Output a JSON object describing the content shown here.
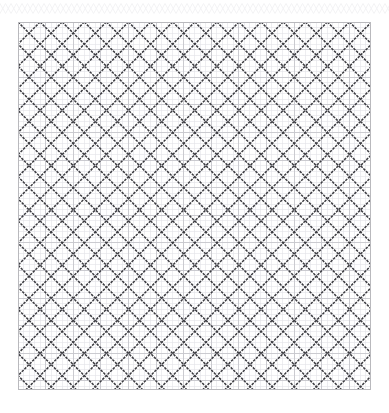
{
  "page": {
    "width": 389,
    "height": 413,
    "background_color": "#ffffff",
    "title": "",
    "caption": ""
  },
  "top_band": {
    "name": "decorative-zigzag-band",
    "x": 0,
    "y": 0,
    "width": 389,
    "height": 15,
    "stroke_color": "#e9e9ec",
    "stroke_width": 1,
    "motif": "zigzag-crosshatch",
    "period": 11,
    "amplitude": 5
  },
  "panel": {
    "name": "graph-paper-panel",
    "x": 18,
    "y": 22,
    "width": 353,
    "height": 368,
    "background_color": "#ffffff",
    "border_color": "#b9b9bd",
    "border_width": 1
  },
  "grid": {
    "minor": {
      "spacing": 5.52,
      "color": "#e3e3e8",
      "width": 0.6,
      "columns": 64,
      "rows": 67
    },
    "major": {
      "spacing": 27.6,
      "color": "#c6c6cc",
      "width": 0.9,
      "columns": 13,
      "rows": 14
    }
  },
  "chart_data": {
    "type": "pattern",
    "title": "",
    "subtitle": "",
    "xlabel": "",
    "ylabel": "",
    "grid": true,
    "legend": "none",
    "motif": "x-cross",
    "lattice": {
      "period_x": 22.1,
      "period_y": 22.1,
      "origin_x": 18,
      "origin_y": 22,
      "cells_x": 16,
      "cells_y": 17,
      "stroke_color": "#3b3b40",
      "stroke_width": 1.5,
      "stroke_texture": "rough-pixelated",
      "diagonal_angles": [
        45,
        -45
      ]
    },
    "axis_ranges": {
      "x": [
        0,
        64
      ],
      "y": [
        0,
        67
      ]
    }
  }
}
